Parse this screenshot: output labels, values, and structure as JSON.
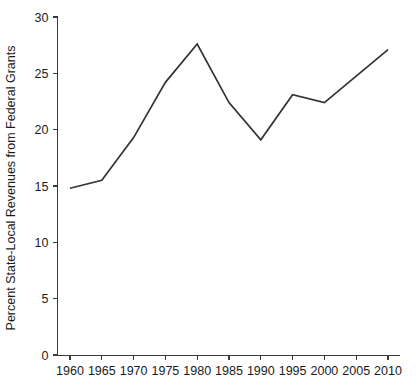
{
  "chart_data": {
    "type": "line",
    "title": "",
    "xlabel": "",
    "ylabel": "Percent State-Local Revenues from Federal Grants",
    "x": [
      1960,
      1965,
      1970,
      1975,
      1980,
      1985,
      1990,
      1995,
      2000,
      2010
    ],
    "values": [
      14.8,
      15.5,
      19.3,
      24.2,
      27.6,
      22.4,
      19.1,
      23.1,
      22.4,
      27.1
    ],
    "series": [
      {
        "name": "Percent State-Local Revenues from Federal Grants",
        "values": [
          14.8,
          15.5,
          19.3,
          24.2,
          27.6,
          22.4,
          19.1,
          23.1,
          22.4,
          27.1
        ]
      }
    ],
    "xlim": [
      1958.5,
      2011.5
    ],
    "ylim": [
      0,
      30
    ],
    "x_ticks": [
      1960,
      1965,
      1970,
      1975,
      1980,
      1985,
      1990,
      1995,
      2000,
      2005,
      2010
    ],
    "x_tick_labels": [
      "1960",
      "1965",
      "1970",
      "1975",
      "1980",
      "1985",
      "1990",
      "1995",
      "2000",
      "2005",
      "2010"
    ],
    "y_ticks": [
      0,
      5,
      10,
      15,
      20,
      25,
      30
    ],
    "y_tick_labels": [
      "0",
      "5",
      "10",
      "15",
      "20",
      "25",
      "30"
    ],
    "grid": false,
    "legend": false,
    "legend_position": "none",
    "line_color": "#333333"
  },
  "axes": {
    "y_axis_title": "Percent State-Local Revenues from Federal Grants",
    "x_axis_title": ""
  }
}
